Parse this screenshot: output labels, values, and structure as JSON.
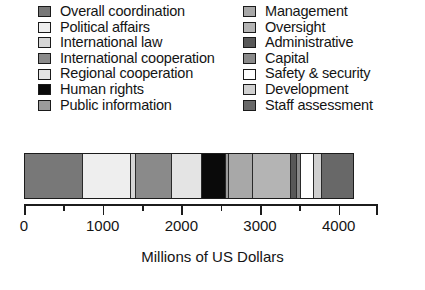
{
  "chart_data": {
    "type": "bar",
    "orientation": "horizontal",
    "stacked": true,
    "title": "",
    "xlabel": "Millions of US Dollars",
    "ylabel": "",
    "xlim": [
      0,
      4500
    ],
    "grid": false,
    "legend_position": "top",
    "tick_labels": [
      "0",
      "1000",
      "2000",
      "3000",
      "4000"
    ],
    "tick_values": [
      0,
      1000,
      2000,
      3000,
      4000
    ],
    "minor_tick_values": [
      500,
      1500,
      2500,
      3500
    ],
    "axis_max": 4500,
    "categories": [
      "Overall coordination",
      "Political affairs",
      "International law",
      "International cooperation",
      "Regional cooperation",
      "Human rights",
      "Public information",
      "Management",
      "Oversight",
      "Administrative",
      "Capital",
      "Safety & security",
      "Development",
      "Staff assessment"
    ],
    "values": [
      732,
      614,
      59,
      460,
      389,
      307,
      35,
      307,
      484,
      71,
      47,
      165,
      106,
      389
    ],
    "colors": [
      "#787878",
      "#eeeeee",
      "#d6d6d6",
      "#8a8a8a",
      "#e4e4e4",
      "#0a0a0a",
      "#9b9b9b",
      "#a8a8a8",
      "#b4b4b4",
      "#585858",
      "#8a8a8a",
      "#ffffff",
      "#d0d0d0",
      "#686868"
    ],
    "total": 4165
  },
  "legend": {
    "left_column": [
      {
        "label": "Overall coordination",
        "color": "#787878"
      },
      {
        "label": "Political affairs",
        "color": "#eeeeee"
      },
      {
        "label": "International law",
        "color": "#d6d6d6"
      },
      {
        "label": "International cooperation",
        "color": "#8a8a8a"
      },
      {
        "label": "Regional cooperation",
        "color": "#e4e4e4"
      },
      {
        "label": "Human rights",
        "color": "#0a0a0a"
      },
      {
        "label": "Public information",
        "color": "#9b9b9b"
      }
    ],
    "right_column": [
      {
        "label": "Management",
        "color": "#a8a8a8"
      },
      {
        "label": "Oversight",
        "color": "#b4b4b4"
      },
      {
        "label": "Administrative",
        "color": "#585858"
      },
      {
        "label": "Capital",
        "color": "#8a8a8a"
      },
      {
        "label": "Safety & security",
        "color": "#ffffff"
      },
      {
        "label": "Development",
        "color": "#d0d0d0"
      },
      {
        "label": "Staff assessment",
        "color": "#686868"
      }
    ]
  }
}
